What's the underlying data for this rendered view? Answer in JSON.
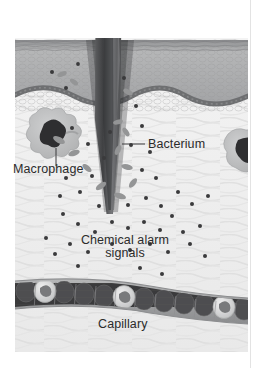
{
  "figure": {
    "kind": "biology-illustration",
    "style": "grayscale halftone textbook diagram"
  },
  "labels": {
    "macrophage": "Macrophage",
    "bacterium": "Bacterium",
    "chemical_signals_line1": "Chemical alarm",
    "chemical_signals_line2": "signals",
    "capillary": "Capillary"
  },
  "structures": {
    "splinter": "splinter",
    "epidermis": "epidermis",
    "basement_membrane": "basement-membrane",
    "dermis": "dermis",
    "capillary_vessel": "capillary-vessel",
    "red_blood_cell": "red-blood-cell",
    "white_blood_cell": "white-blood-cell",
    "macrophage_cell": "macrophage-cell",
    "bacterium_rod": "bacterium-rod",
    "signal_dot": "chemical-signal-dot",
    "leader_line": "leader-line"
  },
  "colors": {
    "page_background": "#ffffff",
    "text": "#2b2b2b",
    "splinter_dark": "#4a4a4c",
    "splinter_light": "#8e8f90",
    "epidermis": "#a8a9aa",
    "epidermis_top": "#8f9092",
    "basement_membrane": "#6e6f71",
    "dermis": "#eeeeee",
    "dermis_fiber": "#dcdcdc",
    "capillary_wall": "#9a9b9c",
    "capillary_lumen": "#3b3b3c",
    "red_blood_cell": "#4e4e50",
    "white_blood_cell": "#d8d8d8",
    "macrophage_body": "#b9babb",
    "macrophage_nucleus": "#2e2e30",
    "bacterium": "#949596",
    "signal_dot": "#3a3a3c",
    "page_rule": "#e3e3e3"
  },
  "counts": {
    "macrophages": 2,
    "white_blood_cells": 3,
    "visible_bacteria": 9
  }
}
